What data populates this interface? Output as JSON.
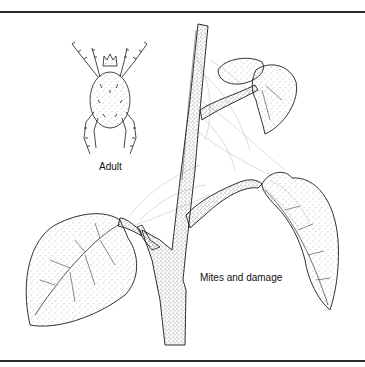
{
  "figure": {
    "labels": {
      "adult": "Adult",
      "damage": "Mites and damage"
    },
    "colors": {
      "ink": "#1a1a1a",
      "paper": "#ffffff",
      "rule": "#2a2a2a",
      "stipple": "#555555",
      "web": "#9a9a9a"
    }
  }
}
